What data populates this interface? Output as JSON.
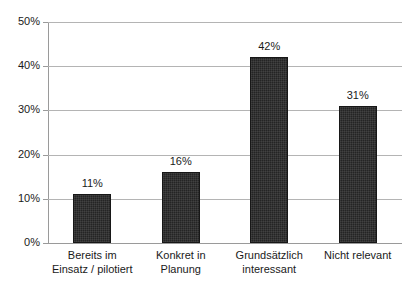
{
  "chart_data": {
    "type": "bar",
    "title": "",
    "subtitle": "",
    "xlabel": "",
    "ylabel": "",
    "categories": [
      "Bereits im\nEinsatz / pilotiert",
      "Konkret in\nPlanung",
      "Grundsätzlich\ninteressant",
      "Nicht relevant"
    ],
    "values": [
      11,
      16,
      42,
      31
    ],
    "value_labels": [
      "11%",
      "16%",
      "42%",
      "31%"
    ],
    "ylim": [
      0,
      50
    ],
    "ytick_values": [
      0,
      10,
      20,
      30,
      40,
      50
    ],
    "ytick_labels": [
      "0%",
      "10%",
      "20%",
      "30%",
      "40%",
      "50%"
    ],
    "grid": "horizontal",
    "legend": "none",
    "series_color": "#242424",
    "grid_color": "#b4b4b4",
    "axis_color": "#9a9a9a",
    "text_color": "#1a1a1a",
    "background": "#ffffff"
  }
}
